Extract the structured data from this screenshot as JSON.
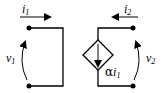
{
  "diagram": {
    "port1": {
      "current_label": "i",
      "current_sub": "1",
      "voltage_label": "v",
      "voltage_sub": "1"
    },
    "port2": {
      "current_label": "i",
      "current_sub": "2",
      "voltage_label": "v",
      "voltage_sub": "2"
    },
    "source": {
      "type": "current-controlled current source",
      "gain_symbol": "α",
      "control_label": "i",
      "control_sub": "1"
    }
  }
}
